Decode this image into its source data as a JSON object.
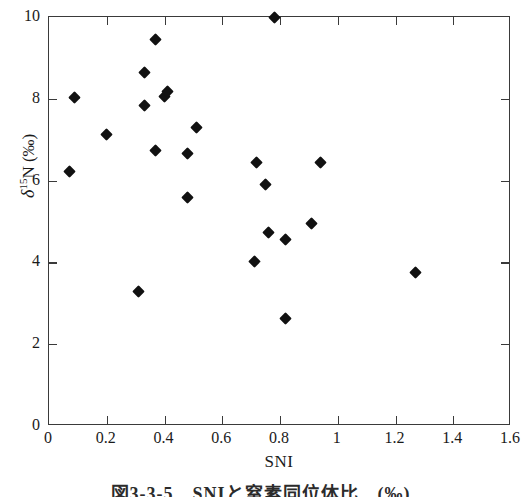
{
  "figure": {
    "caption": "図3-3-5　SNIと窒素同位体比　(‰)"
  },
  "chart_data": {
    "type": "scatter",
    "title": "",
    "xlabel": "SNI",
    "ylabel": "δ15N (‰)",
    "ylabel_parts": {
      "delta": "δ",
      "superscript": "15",
      "element": "N",
      "unit": "(‰)"
    },
    "xlim": [
      0,
      1.6
    ],
    "ylim": [
      0,
      10
    ],
    "xticks": [
      0,
      0.2,
      0.4,
      0.6,
      0.8,
      1,
      1.2,
      1.4,
      1.6
    ],
    "xtick_labels": [
      "0",
      "0.2",
      "0.4",
      "0.6",
      "0.8",
      "1",
      "1.2",
      "1.4",
      "1.6"
    ],
    "yticks": [
      0,
      2,
      4,
      6,
      8,
      10
    ],
    "ytick_labels": [
      "0",
      "2",
      "4",
      "6",
      "8",
      "10"
    ],
    "grid": false,
    "legend": null,
    "marker": "filled-diamond",
    "marker_color": "#111111",
    "frame": "box-all-sides-ticks-inward",
    "points": [
      {
        "x": 0.07,
        "y": 6.22
      },
      {
        "x": 0.09,
        "y": 8.02
      },
      {
        "x": 0.2,
        "y": 7.12
      },
      {
        "x": 0.31,
        "y": 3.3
      },
      {
        "x": 0.33,
        "y": 8.65
      },
      {
        "x": 0.33,
        "y": 7.83
      },
      {
        "x": 0.37,
        "y": 9.45
      },
      {
        "x": 0.37,
        "y": 6.74
      },
      {
        "x": 0.4,
        "y": 8.05
      },
      {
        "x": 0.41,
        "y": 8.18
      },
      {
        "x": 0.48,
        "y": 5.58
      },
      {
        "x": 0.48,
        "y": 6.66
      },
      {
        "x": 0.51,
        "y": 7.3
      },
      {
        "x": 0.71,
        "y": 4.02
      },
      {
        "x": 0.72,
        "y": 6.45
      },
      {
        "x": 0.75,
        "y": 5.9
      },
      {
        "x": 0.76,
        "y": 4.72
      },
      {
        "x": 0.78,
        "y": 10.0
      },
      {
        "x": 0.82,
        "y": 4.56
      },
      {
        "x": 0.82,
        "y": 2.62
      },
      {
        "x": 0.91,
        "y": 4.95
      },
      {
        "x": 0.94,
        "y": 6.45
      },
      {
        "x": 1.27,
        "y": 3.75
      }
    ]
  }
}
